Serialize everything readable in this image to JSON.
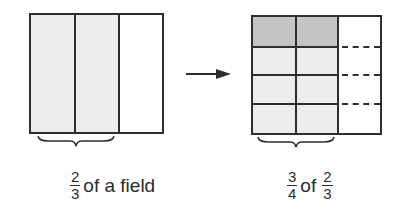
{
  "colors": {
    "line": "#2e2e2e",
    "light_shade": "#ececec",
    "dark_shade": "#c4c4c4",
    "background": "#ffffff"
  },
  "left_figure": {
    "columns": 3,
    "shaded_columns": 2,
    "label": {
      "fraction": {
        "numerator": "2",
        "denominator": "3"
      },
      "text": "of a field"
    }
  },
  "arrow": {
    "direction": "right"
  },
  "right_figure": {
    "columns": 3,
    "rows": 4,
    "shaded_columns": 2,
    "highlighted_row": 1,
    "dashed_row_lines_in_column": 3,
    "label": {
      "fraction1": {
        "numerator": "3",
        "denominator": "4"
      },
      "text": "of",
      "fraction2": {
        "numerator": "2",
        "denominator": "3"
      }
    }
  }
}
